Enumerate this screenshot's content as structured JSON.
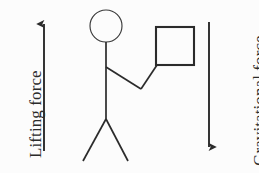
{
  "canvas": {
    "width": 259,
    "height": 173,
    "background_color": "#fcfcfc",
    "stroke_color": "#2b2b2b"
  },
  "labels": {
    "lifting_force": "Lifting force",
    "gravitational_force": "Gravitational force"
  },
  "arrows": {
    "lifting": {
      "direction": "up",
      "x": 44,
      "y_top": 22,
      "y_bottom": 151
    },
    "gravitational": {
      "direction": "down",
      "x": 209,
      "y_top": 22,
      "y_bottom": 149
    }
  },
  "figure": {
    "head": {
      "cx": 106,
      "cy": 26,
      "r": 16
    },
    "torso": {
      "x": 106,
      "y_top": 42,
      "y_bottom": 119
    },
    "shoulder_y": 67,
    "elbow": {
      "x": 141,
      "y": 89
    },
    "legs": {
      "hip_y": 119,
      "left_foot": {
        "x": 83,
        "y": 161
      },
      "right_foot": {
        "x": 128,
        "y": 161
      }
    }
  },
  "box": {
    "x": 156,
    "y": 27,
    "width": 38,
    "height": 38
  }
}
